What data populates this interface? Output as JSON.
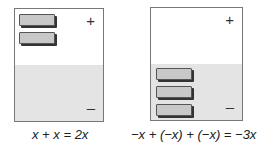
{
  "left_mat": {
    "plus_sign": "+",
    "minus_sign": "–",
    "positive_tiles": 2,
    "negative_tiles": 0,
    "caption": "x + x = 2x"
  },
  "right_mat": {
    "plus_sign": "+",
    "minus_sign": "–",
    "positive_tiles": 0,
    "negative_tiles": 3,
    "caption": "−x + (−x) + (−x) = −3x"
  },
  "colors": {
    "tile_fill": "#c8c8c8",
    "negative_region": "#e4e4e4",
    "positive_region": "#ffffff"
  }
}
